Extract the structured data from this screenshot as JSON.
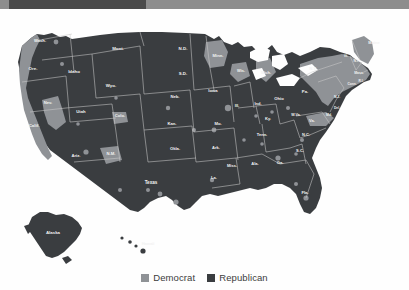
{
  "banner": {
    "bar_color": "#4a4a4a",
    "track_color": "#8d8d8d"
  },
  "map": {
    "title": "United States county-level presidential election results",
    "ocean_color": "#fefefe",
    "border_color": "#c9c9c9",
    "democrat_color": "#8f9296",
    "republican_color": "#3a3d40",
    "state_labels": [
      {
        "id": "wash",
        "text": "Wash.",
        "x": 40,
        "y": 30,
        "size": 4.2
      },
      {
        "id": "ore",
        "text": "Ore.",
        "x": 33,
        "y": 58,
        "size": 4.4
      },
      {
        "id": "idaho",
        "text": "Idaho",
        "x": 74,
        "y": 61,
        "size": 4.4
      },
      {
        "id": "mont",
        "text": "Mont.",
        "x": 118,
        "y": 38,
        "size": 4.4
      },
      {
        "id": "wyo",
        "text": "Wyo.",
        "x": 111,
        "y": 75,
        "size": 4.4
      },
      {
        "id": "nd",
        "text": "N.D.",
        "x": 183,
        "y": 38,
        "size": 4.4
      },
      {
        "id": "sd",
        "text": "S.D.",
        "x": 183,
        "y": 63,
        "size": 4.4
      },
      {
        "id": "minn",
        "text": "Minn.",
        "x": 218,
        "y": 45,
        "size": 4.2
      },
      {
        "id": "wis",
        "text": "Wis.",
        "x": 241,
        "y": 60,
        "size": 4.0
      },
      {
        "id": "mich",
        "text": "Mich.",
        "x": 266,
        "y": 62,
        "size": 4.0
      },
      {
        "id": "nev",
        "text": "Nev.",
        "x": 48,
        "y": 92,
        "size": 4.2
      },
      {
        "id": "utah",
        "text": "Utah",
        "x": 81,
        "y": 101,
        "size": 4.2
      },
      {
        "id": "colo",
        "text": "Colo.",
        "x": 120,
        "y": 105,
        "size": 4.2
      },
      {
        "id": "neb",
        "text": "Neb.",
        "x": 175,
        "y": 86,
        "size": 4.2
      },
      {
        "id": "iowa",
        "text": "Iowa",
        "x": 213,
        "y": 80,
        "size": 4.2
      },
      {
        "id": "ill",
        "text": "Ill.",
        "x": 237,
        "y": 95,
        "size": 4.0
      },
      {
        "id": "ind",
        "text": "Ind.",
        "x": 258,
        "y": 93,
        "size": 4.0
      },
      {
        "id": "ohio",
        "text": "Ohio",
        "x": 279,
        "y": 88,
        "size": 4.2
      },
      {
        "id": "pa",
        "text": "Pa.",
        "x": 305,
        "y": 81,
        "size": 4.2
      },
      {
        "id": "ny",
        "text": "N.Y.",
        "x": 313,
        "y": 58,
        "size": 4.2
      },
      {
        "id": "maine",
        "text": "Maine",
        "x": 374,
        "y": 32,
        "size": 4.0
      },
      {
        "id": "vt",
        "text": "Vt.",
        "x": 346,
        "y": 45,
        "size": 3.6
      },
      {
        "id": "nh",
        "text": "N.H.",
        "x": 357,
        "y": 50,
        "size": 3.4
      },
      {
        "id": "mass",
        "text": "Mass.",
        "x": 359,
        "y": 62,
        "size": 3.4
      },
      {
        "id": "ri",
        "text": "R.I.",
        "x": 361,
        "y": 70,
        "size": 3.2
      },
      {
        "id": "conn",
        "text": "Conn.",
        "x": 352,
        "y": 73,
        "size": 3.2
      },
      {
        "id": "nj",
        "text": "N.J.",
        "x": 337,
        "y": 86,
        "size": 3.4
      },
      {
        "id": "del",
        "text": "Del.",
        "x": 337,
        "y": 97,
        "size": 3.2
      },
      {
        "id": "md",
        "text": "Md.",
        "x": 329,
        "y": 104,
        "size": 3.4
      },
      {
        "id": "wva",
        "text": "W.Va.",
        "x": 296,
        "y": 104,
        "size": 3.6
      },
      {
        "id": "va",
        "text": "Va.",
        "x": 312,
        "y": 110,
        "size": 4.0
      },
      {
        "id": "ky",
        "text": "Ky.",
        "x": 268,
        "y": 108,
        "size": 4.0
      },
      {
        "id": "calif",
        "text": "Calif.",
        "x": 34,
        "y": 115,
        "size": 4.4
      },
      {
        "id": "kan",
        "text": "Kan.",
        "x": 172,
        "y": 113,
        "size": 4.2
      },
      {
        "id": "mo",
        "text": "Mo.",
        "x": 218,
        "y": 113,
        "size": 4.2
      },
      {
        "id": "ariz",
        "text": "Ariz.",
        "x": 76,
        "y": 145,
        "size": 4.2
      },
      {
        "id": "nm",
        "text": "N.M.",
        "x": 111,
        "y": 143,
        "size": 4.2
      },
      {
        "id": "okla",
        "text": "Okla.",
        "x": 175,
        "y": 138,
        "size": 4.2
      },
      {
        "id": "ark",
        "text": "Ark.",
        "x": 216,
        "y": 137,
        "size": 4.0
      },
      {
        "id": "tenn",
        "text": "Tenn.",
        "x": 262,
        "y": 124,
        "size": 4.0
      },
      {
        "id": "nc",
        "text": "N.C.",
        "x": 306,
        "y": 124,
        "size": 4.0
      },
      {
        "id": "sc",
        "text": "S.C.",
        "x": 300,
        "y": 140,
        "size": 4.0
      },
      {
        "id": "miss",
        "text": "Miss.",
        "x": 232,
        "y": 155,
        "size": 4.0
      },
      {
        "id": "ala",
        "text": "Ala.",
        "x": 255,
        "y": 153,
        "size": 4.0
      },
      {
        "id": "ga",
        "text": "Ga.",
        "x": 280,
        "y": 152,
        "size": 4.2
      },
      {
        "id": "la",
        "text": "La.",
        "x": 214,
        "y": 167,
        "size": 4.0
      },
      {
        "id": "texas",
        "text": "Texas",
        "x": 151,
        "y": 172,
        "size": 4.6
      },
      {
        "id": "fla",
        "text": "Fla.",
        "x": 305,
        "y": 182,
        "size": 4.2
      },
      {
        "id": "alaska",
        "text": "Alaska",
        "x": 53,
        "y": 222,
        "size": 4.4
      },
      {
        "id": "hawaii",
        "text": "Hawaii",
        "x": 148,
        "y": 233,
        "size": 4.0
      }
    ]
  },
  "legend": {
    "items": [
      {
        "id": "democrat",
        "label": "Democrat",
        "color": "#8f9296"
      },
      {
        "id": "republican",
        "label": "Republican",
        "color": "#3a3d40"
      }
    ]
  },
  "chart_data": {
    "type": "map",
    "legend_position": "bottom-center",
    "categories": [
      "Democrat",
      "Republican"
    ],
    "colors": [
      "#8f9296",
      "#3a3d40"
    ],
    "regions": [
      {
        "name": "Wash.",
        "winner": "Democrat"
      },
      {
        "name": "Ore.",
        "winner": "Democrat"
      },
      {
        "name": "Calif.",
        "winner": "Democrat"
      },
      {
        "name": "Nev.",
        "winner": "Democrat"
      },
      {
        "name": "Idaho",
        "winner": "Republican"
      },
      {
        "name": "Mont.",
        "winner": "Republican"
      },
      {
        "name": "Wyo.",
        "winner": "Republican"
      },
      {
        "name": "Utah",
        "winner": "Republican"
      },
      {
        "name": "Ariz.",
        "winner": "Republican"
      },
      {
        "name": "Colo.",
        "winner": "Democrat"
      },
      {
        "name": "N.M.",
        "winner": "Democrat"
      },
      {
        "name": "N.D.",
        "winner": "Republican"
      },
      {
        "name": "S.D.",
        "winner": "Republican"
      },
      {
        "name": "Neb.",
        "winner": "Republican"
      },
      {
        "name": "Kan.",
        "winner": "Republican"
      },
      {
        "name": "Okla.",
        "winner": "Republican"
      },
      {
        "name": "Texas",
        "winner": "Republican"
      },
      {
        "name": "Minn.",
        "winner": "Democrat"
      },
      {
        "name": "Iowa",
        "winner": "Republican"
      },
      {
        "name": "Mo.",
        "winner": "Republican"
      },
      {
        "name": "Ark.",
        "winner": "Republican"
      },
      {
        "name": "La.",
        "winner": "Republican"
      },
      {
        "name": "Wis.",
        "winner": "Democrat"
      },
      {
        "name": "Ill.",
        "winner": "Democrat"
      },
      {
        "name": "Miss.",
        "winner": "Republican"
      },
      {
        "name": "Mich.",
        "winner": "Democrat"
      },
      {
        "name": "Ind.",
        "winner": "Republican"
      },
      {
        "name": "Ky.",
        "winner": "Republican"
      },
      {
        "name": "Tenn.",
        "winner": "Republican"
      },
      {
        "name": "Ala.",
        "winner": "Republican"
      },
      {
        "name": "Ohio",
        "winner": "Republican"
      },
      {
        "name": "W.Va.",
        "winner": "Republican"
      },
      {
        "name": "Ga.",
        "winner": "Republican"
      },
      {
        "name": "Fla.",
        "winner": "Republican"
      },
      {
        "name": "S.C.",
        "winner": "Republican"
      },
      {
        "name": "N.C.",
        "winner": "Republican"
      },
      {
        "name": "Va.",
        "winner": "Democrat"
      },
      {
        "name": "Pa.",
        "winner": "Democrat"
      },
      {
        "name": "N.Y.",
        "winner": "Democrat"
      },
      {
        "name": "Md.",
        "winner": "Democrat"
      },
      {
        "name": "Del.",
        "winner": "Democrat"
      },
      {
        "name": "N.J.",
        "winner": "Democrat"
      },
      {
        "name": "Conn.",
        "winner": "Democrat"
      },
      {
        "name": "R.I.",
        "winner": "Democrat"
      },
      {
        "name": "Mass.",
        "winner": "Democrat"
      },
      {
        "name": "Vt.",
        "winner": "Democrat"
      },
      {
        "name": "N.H.",
        "winner": "Democrat"
      },
      {
        "name": "Maine",
        "winner": "Democrat"
      },
      {
        "name": "Alaska",
        "winner": "Republican"
      },
      {
        "name": "Hawaii",
        "winner": "Democrat"
      }
    ]
  }
}
